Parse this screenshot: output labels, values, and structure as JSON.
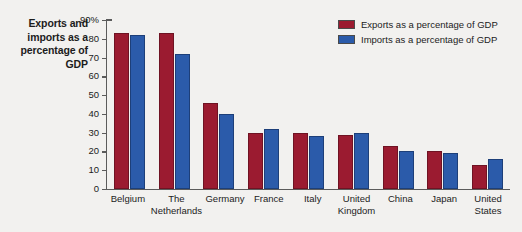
{
  "title": {
    "line1": "Exports and",
    "line2": "imports as a",
    "line3": "percentage of",
    "line4": "GDP",
    "full": "Exports and imports as a percentage of GDP"
  },
  "legend": {
    "position": "top-right",
    "items": [
      {
        "label": "Exports as a percentage of GDP",
        "color": "#9B1B30",
        "swatch_name": "legend-swatch-exports"
      },
      {
        "label": "Imports as a percentage of GDP",
        "color": "#2B5BAA",
        "swatch_name": "legend-swatch-imports"
      }
    ]
  },
  "axis": {
    "y_top_label": "90%",
    "ticks": [
      "90%",
      "80",
      "70",
      "60",
      "50",
      "40",
      "30",
      "20",
      "10",
      "0"
    ],
    "tick_values": [
      90,
      80,
      70,
      60,
      50,
      40,
      30,
      20,
      10,
      0
    ]
  },
  "chart_data": {
    "type": "bar",
    "title": "Exports and imports as a percentage of GDP",
    "xlabel": "",
    "ylabel": "Exports and imports as a percentage of GDP",
    "ylim": [
      0,
      90
    ],
    "ytick_step": 10,
    "grid": false,
    "legend_position": "top-right",
    "categories": [
      "Belgium",
      "The Netherlands",
      "Germany",
      "France",
      "Italy",
      "United Kingdom",
      "China",
      "Japan",
      "United States"
    ],
    "category_lines": [
      [
        "Belgium"
      ],
      [
        "The",
        "Netherlands"
      ],
      [
        "Germany"
      ],
      [
        "France"
      ],
      [
        "Italy"
      ],
      [
        "United",
        "Kingdom"
      ],
      [
        "China"
      ],
      [
        "Japan"
      ],
      [
        "United",
        "States"
      ]
    ],
    "series": [
      {
        "name": "Exports as a percentage of GDP",
        "color": "#9B1B30",
        "values": [
          83,
          83,
          46,
          30,
          30,
          29,
          23,
          20,
          13
        ]
      },
      {
        "name": "Imports as a percentage of GDP",
        "color": "#2B5BAA",
        "values": [
          82,
          72,
          40,
          32,
          28,
          30,
          20,
          19,
          16
        ]
      }
    ]
  }
}
